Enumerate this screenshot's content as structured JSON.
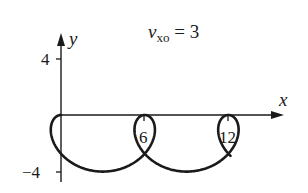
{
  "chart_data": {
    "type": "line",
    "title_parts": {
      "main": "v",
      "sub": "xo",
      "rest": " = 3"
    },
    "xlabel": "x",
    "ylabel": "y",
    "x_ticks": [
      6,
      12
    ],
    "x_tick_labels": [
      "6",
      "12"
    ],
    "y_ticks": [
      4,
      -4
    ],
    "y_tick_labels": [
      "4",
      "−4"
    ],
    "xlim": [
      0,
      14.8
    ],
    "ylim": [
      -4.2,
      5.6
    ],
    "grid": false,
    "legend": null,
    "series": [
      {
        "name": "trajectory (looping trochoid)",
        "parametric": {
          "x": "(3/pi)*t - 2*sin(t)",
          "y": "-2 + 2*cos(t)",
          "t_range": [
            0,
            14.6
          ]
        },
        "key_points": [
          {
            "x": 0,
            "y": 0,
            "note": "start, top of arch"
          },
          {
            "x": 3,
            "y": -1.1,
            "note": "loop crossing"
          },
          {
            "x": 3,
            "y": -4,
            "note": "loop bottom"
          },
          {
            "x": 6,
            "y": 0,
            "note": "top of arch"
          },
          {
            "x": 9,
            "y": -1.1,
            "note": "loop crossing"
          },
          {
            "x": 9,
            "y": -4,
            "note": "loop bottom"
          },
          {
            "x": 12,
            "y": 0,
            "note": "top of arch"
          },
          {
            "x": 14.8,
            "y": -1.0,
            "note": "curve end"
          }
        ]
      }
    ]
  },
  "colors": {
    "ink": "#1a1a1a",
    "background": "#ffffff"
  }
}
